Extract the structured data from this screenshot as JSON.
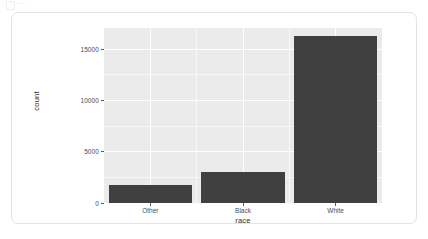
{
  "figure": {
    "corner_mark": "image-placeholder-icon",
    "panel_background": "#EBEBEB",
    "card_background": "#FFFFFF",
    "card_border": "#E3E3E3"
  },
  "chart_data": {
    "type": "bar",
    "title": "",
    "subtitle": "",
    "xlabel": "race",
    "ylabel": "count",
    "categories": [
      "Other",
      "Black",
      "White"
    ],
    "values": [
      1800,
      3050,
      16250
    ],
    "series": [
      {
        "name": "count",
        "values": [
          1800,
          3050,
          16250
        ]
      }
    ],
    "ylim": [
      0,
      17050
    ],
    "xlim_categorical": [
      "Other",
      "Black",
      "White"
    ],
    "y_ticks": [
      0,
      5000,
      10000,
      15000
    ],
    "y_tick_labels": [
      "0",
      "5000",
      "10000",
      "15000"
    ],
    "x_tick_labels": [
      "Other",
      "Black",
      "White"
    ],
    "bar_color": "#404040",
    "grid": {
      "enabled": true,
      "major_color": "#FFFFFF",
      "minor_color": "#F7F7F7",
      "horizontal_major_at": [
        0,
        5000,
        10000,
        15000
      ],
      "horizontal_minor_at": [
        2500,
        7500,
        12500,
        17500
      ],
      "vertical_major_at": [
        "Other",
        "Black",
        "White"
      ]
    },
    "legend": {
      "visible": false,
      "position": "none",
      "entries": []
    },
    "annotations": []
  }
}
